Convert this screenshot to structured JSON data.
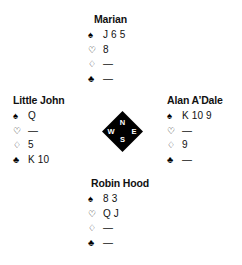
{
  "diagram": {
    "type": "bridge-hand-diagram",
    "background_color": "#ffffff",
    "text_color": "#111111",
    "compass": {
      "fill_color": "#000000",
      "label_color": "#ffffff",
      "north": "N",
      "south": "S",
      "west": "W",
      "east": "E"
    },
    "suit_symbols": {
      "spade": "♠",
      "heart": "♡",
      "diamond": "♢",
      "club": "♣"
    },
    "void_marker": "—",
    "hands": {
      "north": {
        "position": "North",
        "player": "Marian",
        "spades": "J 6 5",
        "hearts": "8",
        "diamonds": "—",
        "clubs": "—"
      },
      "west": {
        "position": "West",
        "player": "Little John",
        "spades": "Q",
        "hearts": "—",
        "diamonds": "5",
        "clubs": "K 10"
      },
      "east": {
        "position": "East",
        "player": "Alan A’Dale",
        "spades": "K 10 9",
        "hearts": "—",
        "diamonds": "9",
        "clubs": "—"
      },
      "south": {
        "position": "South",
        "player": "Robin Hood",
        "spades": "8 3",
        "hearts": "Q J",
        "diamonds": "—",
        "clubs": "—"
      }
    }
  }
}
